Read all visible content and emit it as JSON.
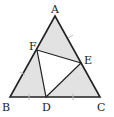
{
  "diagram": {
    "type": "geometry",
    "fill_color": "#e2e2e2",
    "stroke_color": "#222222",
    "inner_fill_color": "#ffffff",
    "points": {
      "A": {
        "label": "A",
        "x": 55,
        "y": 16
      },
      "B": {
        "label": "B",
        "x": 10,
        "y": 97
      },
      "C": {
        "label": "C",
        "x": 100,
        "y": 97
      },
      "D": {
        "label": "D",
        "x": 46,
        "y": 97
      },
      "E": {
        "label": "E",
        "x": 81,
        "y": 63
      },
      "F": {
        "label": "F",
        "x": 37,
        "y": 50
      }
    },
    "segments": [
      "AB",
      "BC",
      "CA",
      "DE",
      "EF",
      "FD"
    ],
    "labels": {
      "A": "A",
      "B": "B",
      "C": "C",
      "D": "D",
      "E": "E",
      "F": "F"
    }
  }
}
